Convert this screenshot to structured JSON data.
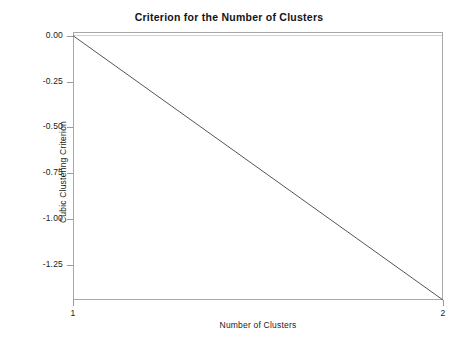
{
  "chart_data": {
    "type": "line",
    "title": "Criterion for the Number of Clusters",
    "xlabel": "Number of Clusters",
    "ylabel": "Cubic Clustering Criterion",
    "x": [
      1,
      2
    ],
    "series": [
      {
        "name": "Cubic Clustering Criterion",
        "values": [
          0.0,
          -1.44
        ],
        "color": "#555555"
      }
    ],
    "xlim": [
      1,
      2
    ],
    "ylim": [
      -1.44,
      0.02
    ],
    "xticks": [
      1,
      2
    ],
    "xticklabels": [
      "1",
      "2"
    ],
    "yticks": [
      0.0,
      -0.25,
      -0.5,
      -0.75,
      -1.0,
      -1.25
    ],
    "yticklabels": [
      "0.00",
      "-0.25",
      "-0.50",
      "-0.75",
      "-1.00",
      "-1.25"
    ],
    "grid": false,
    "legend": false,
    "frame_color": "#a8a8a8",
    "background": "#ffffff"
  }
}
